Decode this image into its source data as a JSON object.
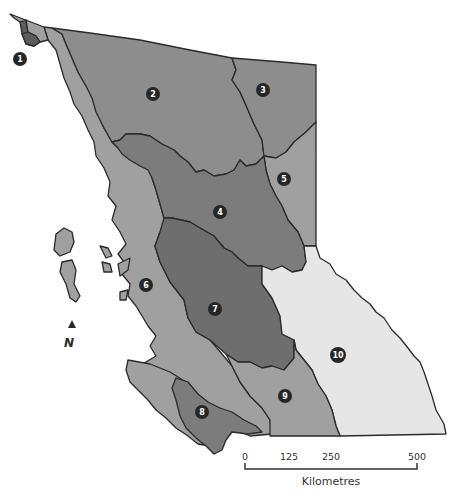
{
  "map": {
    "title": "British Columbia regions",
    "colors": {
      "dark": "#6e6e6e",
      "medium_dark": "#7c7c7c",
      "medium": "#8d8d8d",
      "light": "#a0a0a0",
      "lightest": "#e6e6e6",
      "border": "#2a2a2a",
      "marker": "#262626"
    },
    "regions": [
      {
        "id": "1",
        "label": "1"
      },
      {
        "id": "2",
        "label": "2"
      },
      {
        "id": "3",
        "label": "3"
      },
      {
        "id": "4",
        "label": "4"
      },
      {
        "id": "5",
        "label": "5"
      },
      {
        "id": "6",
        "label": "6"
      },
      {
        "id": "7",
        "label": "7"
      },
      {
        "id": "8",
        "label": "8"
      },
      {
        "id": "9",
        "label": "9"
      },
      {
        "id": "10",
        "label": "10"
      }
    ]
  },
  "north_arrow": {
    "label": "N"
  },
  "scale_bar": {
    "ticks": [
      "0",
      "125",
      "250",
      "500"
    ],
    "unit_label": "Kilometres"
  }
}
